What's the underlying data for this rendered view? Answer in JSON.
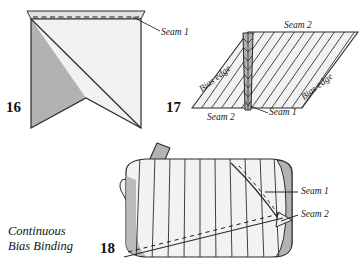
{
  "page": {
    "width": 362,
    "height": 267,
    "background": "#ffffff"
  },
  "colors": {
    "fabric_light": "#f0f0f0",
    "fabric_mid": "#e2e2e2",
    "fabric_dark": "#b2b2b2",
    "fabric_darker": "#9a9a9a",
    "stroke": "#2b2b2b",
    "text": "#111111"
  },
  "caption": {
    "line1": "Continuous",
    "line2": "Bias Binding"
  },
  "figures": [
    {
      "id": "figure-16",
      "number": "16",
      "labels": [
        {
          "name": "seam-1",
          "text": "Seam 1"
        }
      ]
    },
    {
      "id": "figure-17",
      "number": "17",
      "labels": [
        {
          "name": "seam-2-top",
          "text": "Seam 2"
        },
        {
          "name": "seam-2-bottom",
          "text": "Seam 2"
        },
        {
          "name": "seam-1-right",
          "text": "Seam 1"
        },
        {
          "name": "bias-edge-left",
          "text": "Bias edge"
        },
        {
          "name": "bias-edge-right",
          "text": "Bias edge"
        }
      ]
    },
    {
      "id": "figure-18",
      "number": "18",
      "labels": [
        {
          "name": "seam-1",
          "text": "Seam 1"
        },
        {
          "name": "seam-2",
          "text": "Seam 2"
        }
      ]
    }
  ]
}
